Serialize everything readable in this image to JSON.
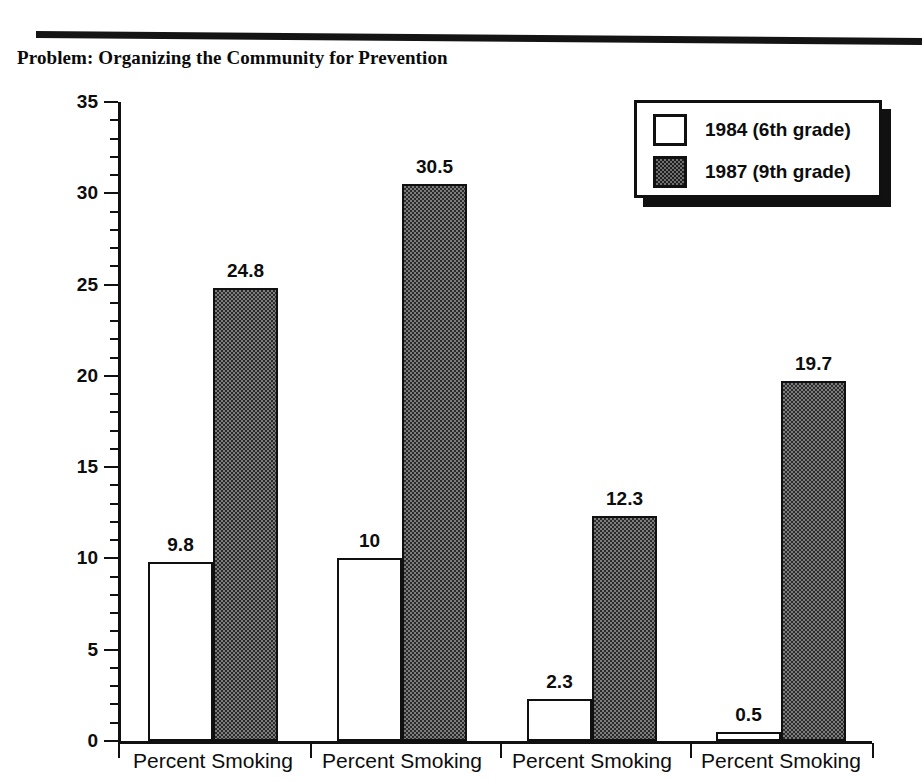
{
  "document": {
    "title": "Problem: Organizing the Community for Prevention"
  },
  "chart_data": {
    "type": "bar",
    "title": "Problem: Organizing the Community for Prevention",
    "xlabel": "",
    "ylabel": "",
    "ylim": [
      0,
      35
    ],
    "ytick_step": 5,
    "yticks": [
      "0",
      "5",
      "10",
      "15",
      "20",
      "25",
      "30",
      "35"
    ],
    "minor_tick_step": 1,
    "grid": false,
    "legend_position": "top-right",
    "categories": [
      "Percent Smoking",
      "Percent Smoking",
      "Percent Smoking",
      "Percent Smoking"
    ],
    "series": [
      {
        "name": "1984 (6th grade)",
        "color": "#ffffff",
        "values": [
          9.8,
          10,
          2.3,
          0.5
        ],
        "labels": [
          "9.8",
          "10",
          "2.3",
          "0.5"
        ]
      },
      {
        "name": "1987 (9th grade)",
        "color": "#7c7c7c",
        "values": [
          24.8,
          30.5,
          12.3,
          19.7
        ],
        "labels": [
          "24.8",
          "30.5",
          "12.3",
          "19.7"
        ]
      }
    ]
  },
  "legend": {
    "entries": [
      {
        "label": "1984 (6th grade)",
        "swatch": "light"
      },
      {
        "label": "1987 (9th grade)",
        "swatch": "dark"
      }
    ]
  },
  "axis": {
    "y_labels": [
      "35",
      "30",
      "25",
      "20",
      "15",
      "10",
      "5",
      "0"
    ]
  },
  "colors": {
    "ink": "#111111",
    "bar_light": "#ffffff",
    "bar_dark": "#7c7c7c",
    "background": "#ffffff"
  }
}
